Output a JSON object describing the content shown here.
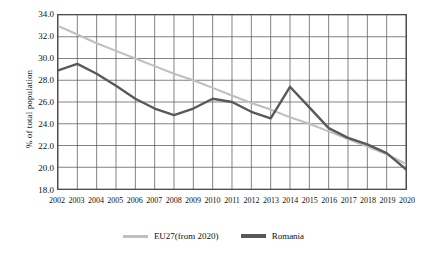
{
  "chart_data": {
    "type": "line",
    "title": "",
    "xlabel": "",
    "ylabel": "% of total population",
    "ylim": [
      18.0,
      34.0
    ],
    "ytick_step": 2.0,
    "ytick_labels": [
      "34.0",
      "32.0",
      "30.0",
      "28.0",
      "26.0",
      "24.0",
      "22.0",
      "20.0",
      "18.0"
    ],
    "ytick_values": [
      34.0,
      32.0,
      30.0,
      28.0,
      26.0,
      24.0,
      22.0,
      20.0,
      18.0
    ],
    "grid": true,
    "legend_position": "bottom",
    "categories": [
      "2002",
      "2003",
      "2004",
      "2005",
      "2006",
      "2007",
      "2008",
      "2009",
      "2010",
      "2011",
      "2012",
      "2013",
      "2014",
      "2015",
      "2016",
      "2017",
      "2018",
      "2019",
      "2020"
    ],
    "x": [
      2002,
      2003,
      2004,
      2005,
      2006,
      2007,
      2008,
      2009,
      2010,
      2011,
      2012,
      2013,
      2014,
      2015,
      2016,
      2017,
      2018,
      2019,
      2020
    ],
    "series": [
      {
        "name": "EU27(from 2020)",
        "color": "#bfbfbf",
        "values": [
          33.0,
          32.2,
          31.4,
          30.7,
          30.0,
          29.3,
          28.6,
          28.0,
          27.3,
          26.6,
          25.9,
          25.3,
          24.6,
          24.0,
          23.3,
          22.6,
          21.9,
          21.2,
          20.3
        ]
      },
      {
        "name": "Romania",
        "color": "#595959",
        "values": [
          28.9,
          29.5,
          28.6,
          27.5,
          26.3,
          25.4,
          24.8,
          25.4,
          26.3,
          26.0,
          25.1,
          24.5,
          27.4,
          25.5,
          23.6,
          22.7,
          22.1,
          21.3,
          19.8
        ]
      }
    ]
  },
  "legend": {
    "items": [
      {
        "label": "EU27(from 2020)",
        "color": "#bfbfbf"
      },
      {
        "label": "Romania",
        "color": "#595959"
      }
    ]
  },
  "colors": {
    "eu27": "#bfbfbf",
    "romania": "#595959",
    "grid": "#4d4d4d",
    "axis": "#4d4d4d",
    "text": "#111111",
    "background": "#ffffff"
  }
}
